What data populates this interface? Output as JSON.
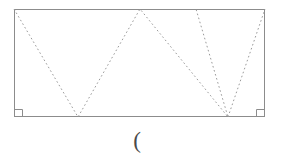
{
  "figure": {
    "type": "geometry-diagram",
    "canvas": {
      "width": 281,
      "height": 157,
      "background": "#ffffff"
    },
    "colors": {
      "rectangle_stroke": "#8c8c8c",
      "dotted_stroke": "#9a9a9a",
      "right_angle_stroke": "#8c8c8c",
      "label_color": "#4a4a4a"
    },
    "rectangle": {
      "name": "outer-rectangle",
      "x": 14,
      "y": 9,
      "width": 251,
      "height": 108,
      "stroke_width": 1
    },
    "right_angle_markers": [
      {
        "name": "bottom-left-right-angle",
        "corner": "bottom-left",
        "x": 14,
        "y": 117,
        "size": 8
      },
      {
        "name": "bottom-right-right-angle",
        "corner": "bottom-right",
        "x": 265,
        "y": 117,
        "size": 8
      }
    ],
    "zigzag_polyline": {
      "name": "dotted-zigzag-path",
      "points": "14,9 78,117 140,9 228,117 196,9",
      "stroke_width": 1,
      "dash_array": "1.6 2.6"
    },
    "extra_segments": [
      {
        "name": "dotted-segment-bottom-vertex-to-top-right",
        "x1": 228,
        "y1": 117,
        "x2": 265,
        "y2": 9,
        "stroke_width": 1,
        "dash_array": "1.6 2.6"
      }
    ],
    "vertices": [
      {
        "name": "vertex-top-left",
        "x": 14,
        "y": 9
      },
      {
        "name": "vertex-bottom-1",
        "x": 78,
        "y": 117
      },
      {
        "name": "vertex-top-apex",
        "x": 140,
        "y": 9
      },
      {
        "name": "vertex-bottom-2",
        "x": 228,
        "y": 117
      },
      {
        "name": "vertex-top-right-inner",
        "x": 196,
        "y": 9
      },
      {
        "name": "vertex-top-right",
        "x": 265,
        "y": 9
      }
    ],
    "caption": {
      "name": "open-paren-label",
      "text": "(",
      "x": 137,
      "y": 141
    }
  }
}
